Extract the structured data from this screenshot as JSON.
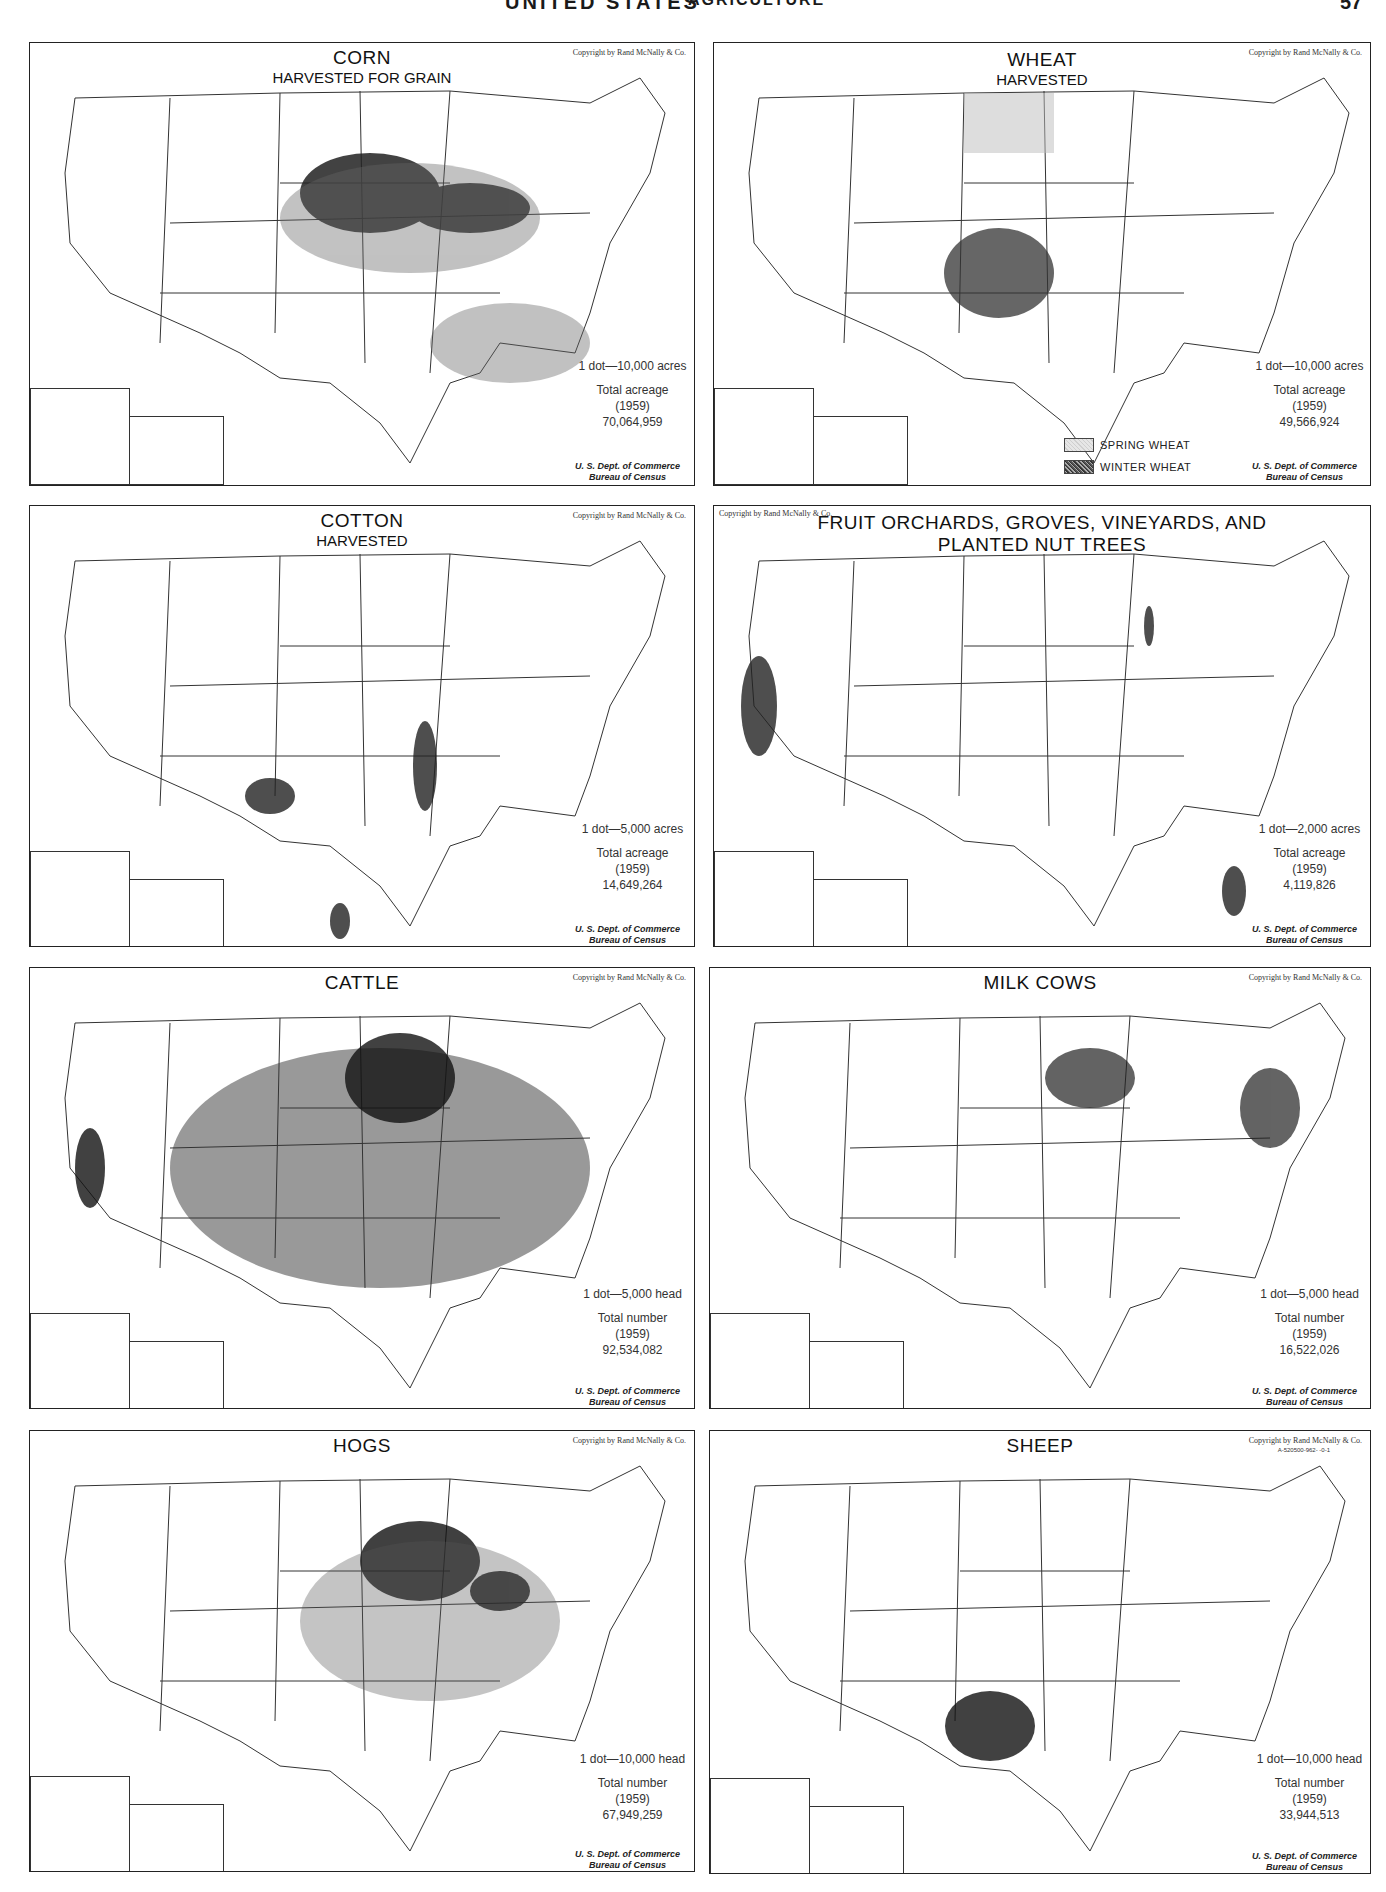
{
  "page": {
    "header_title": "UNITED STATES",
    "header_subtitle": "AGRICULTURE",
    "page_number": "57"
  },
  "common": {
    "copyright": "Copyright by Rand McNally & Co.",
    "source_line1": "U. S. Dept. of Commerce",
    "source_line2": "Bureau of Census",
    "year": "(1959)"
  },
  "maps": {
    "corn": {
      "title": "CORN",
      "subtitle": "HARVESTED FOR GRAIN",
      "scale": "1 dot—10,000 acres",
      "total_label": "Total acreage",
      "total_value": "70,064,959"
    },
    "wheat": {
      "title": "WHEAT",
      "subtitle": "HARVESTED",
      "scale": "1 dot—10,000 acres",
      "total_label": "Total acreage",
      "total_value": "49,566,924",
      "legend": [
        "SPRING WHEAT",
        "WINTER WHEAT"
      ]
    },
    "cotton": {
      "title": "COTTON",
      "subtitle": "HARVESTED",
      "scale": "1 dot—5,000 acres",
      "total_label": "Total acreage",
      "total_value": "14,649,264"
    },
    "fruit": {
      "title_line1": "FRUIT ORCHARDS, GROVES, VINEYARDS, AND",
      "title_line2": "PLANTED NUT TREES",
      "scale": "1 dot—2,000 acres",
      "total_label": "Total acreage",
      "total_value": "4,119,826"
    },
    "cattle": {
      "title": "CATTLE",
      "scale": "1 dot—5,000 head",
      "total_label": "Total number",
      "total_value": "92,534,082"
    },
    "milk_cows": {
      "title": "MILK COWS",
      "scale": "1 dot—5,000 head",
      "total_label": "Total number",
      "total_value": "16,522,026"
    },
    "hogs": {
      "title": "HOGS",
      "scale": "1 dot—10,000 head",
      "total_label": "Total number",
      "total_value": "67,949,259"
    },
    "sheep": {
      "title": "SHEEP",
      "scale": "1 dot—10,000 head",
      "total_label": "Total number",
      "total_value": "33,944,513",
      "plate_code": "A-520500-962-  -0-1"
    }
  }
}
